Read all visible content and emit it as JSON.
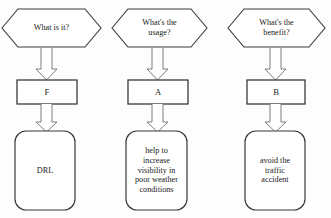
{
  "diagram": {
    "title_fragment": "",
    "stroke_color": "#3a3a3a",
    "fill_color": "#ffffff",
    "background_color": "#fdfdfd",
    "text_color": "#1a1a1a",
    "columns": [
      {
        "id": "column-1",
        "question": "What is it?",
        "label": "F",
        "answer": "DRL",
        "arrow_1": "down-arrow",
        "arrow_2": "down-arrow"
      },
      {
        "id": "column-2",
        "question": "What's the\nusage?",
        "label": "A",
        "answer": "help to\nincrease\nvisibility in\npoor weather\nconditions",
        "arrow_1": "down-arrow",
        "arrow_2": "down-arrow"
      },
      {
        "id": "column-3",
        "question": "What's the\nbenefit?",
        "label": "B",
        "answer": "avoid the\ntraffic\naccident",
        "arrow_1": "down-arrow",
        "arrow_2": "down-arrow"
      }
    ]
  }
}
